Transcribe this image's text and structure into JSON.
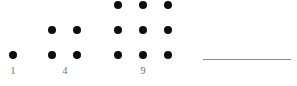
{
  "figure": {
    "name": "square-numbers-dot-diagram",
    "background_color": "#ffffff",
    "dot_color": "#0d0d0d",
    "label_color": "#6e6e6e",
    "rule_color": "#8a8a8a",
    "dot_diameter": 8,
    "grid_spacing": 25,
    "groups": [
      {
        "label": "1",
        "side": 1,
        "count": 1,
        "origin_x": 9,
        "baseline_y": 51,
        "label_x": 6,
        "label_y": 66
      },
      {
        "label": "4",
        "side": 2,
        "count": 4,
        "origin_x": 48,
        "baseline_y": 51,
        "label_x": 58,
        "label_y": 66
      },
      {
        "label": "9",
        "side": 3,
        "count": 9,
        "origin_x": 114,
        "baseline_y": 51,
        "label_x": 136,
        "label_y": 66
      }
    ],
    "rule": {
      "name": "horizontal-rule",
      "x": 203,
      "y": 59,
      "width": 88,
      "thickness": 1
    }
  },
  "chart_data": {
    "type": "scatter",
    "title": "",
    "subtitle": "",
    "xlabel": "",
    "ylabel": "",
    "categories": [
      "1",
      "4",
      "9"
    ],
    "values": [
      1,
      4,
      9
    ],
    "series": [
      {
        "name": "square numbers",
        "values": [
          1,
          4,
          9
        ]
      },
      {
        "name": "side length",
        "values": [
          1,
          2,
          3
        ]
      }
    ],
    "tick_labels": [
      "1",
      "4",
      "9"
    ],
    "legend": [],
    "annotations": [
      "1",
      "4",
      "9"
    ],
    "grid": false,
    "legend_position": "none"
  }
}
